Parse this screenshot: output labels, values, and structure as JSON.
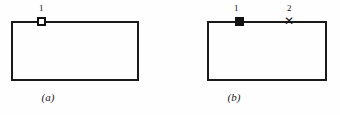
{
  "figure": {
    "panels": [
      {
        "id": "a",
        "caption": "(a)",
        "markers": [
          {
            "label": "1",
            "type": "open-square",
            "glyph": ""
          }
        ]
      },
      {
        "id": "b",
        "caption": "(b)",
        "markers": [
          {
            "label": "1",
            "type": "filled-square",
            "glyph": ""
          },
          {
            "label": "2",
            "type": "cross",
            "glyph": "✕"
          }
        ]
      }
    ]
  },
  "colors": {
    "stroke": "#1a1a1a",
    "marker_fill": "#121212",
    "background": "#fefefe"
  }
}
